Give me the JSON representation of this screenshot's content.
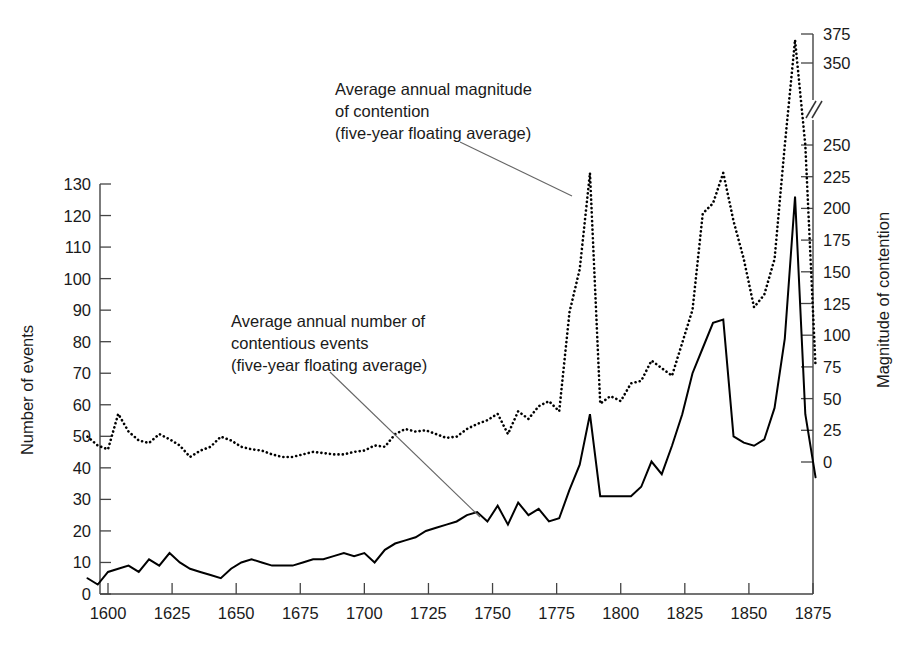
{
  "chart_data": {
    "type": "line",
    "title": "",
    "subtitle": "",
    "xlabel": "",
    "grid": false,
    "legend_position": "inline-annotations",
    "x_axis": {
      "label": "",
      "ticks": [
        1600,
        1625,
        1650,
        1675,
        1700,
        1725,
        1750,
        1775,
        1800,
        1825,
        1850,
        1875
      ],
      "tick_labels": [
        "1600",
        "1625",
        "1650",
        "1675",
        "1700",
        "1725",
        "1750",
        "1775",
        "1800",
        "1825",
        "1850",
        "1875"
      ],
      "xlim": [
        1592,
        1879
      ]
    },
    "y_axis_left": {
      "label": "Number of events",
      "ticks": [
        0,
        10,
        20,
        30,
        40,
        50,
        60,
        70,
        80,
        90,
        100,
        110,
        120,
        130
      ],
      "tick_labels": [
        "0",
        "10",
        "20",
        "30",
        "40",
        "50",
        "60",
        "70",
        "80",
        "90",
        "100",
        "110",
        "120",
        "130"
      ],
      "ylim": [
        0,
        130
      ]
    },
    "y_axis_right": {
      "label": "Magnitude of contention",
      "ticks": [
        0,
        25,
        50,
        75,
        100,
        125,
        150,
        175,
        200,
        225,
        250,
        350,
        375
      ],
      "tick_labels": [
        "0",
        "25",
        "50",
        "75",
        "100",
        "125",
        "150",
        "175",
        "200",
        "225",
        "250",
        "350",
        "375"
      ],
      "ylim": [
        0,
        375
      ],
      "axis_break_between": [
        250,
        350
      ],
      "has_axis_break": true
    },
    "annotations": [
      {
        "id": "magnitude-annotation",
        "lines": [
          "Average annual magnitude",
          "of contention",
          "(five-year floating average)"
        ],
        "text_x": 335,
        "text_y": 95,
        "leader_from": [
          460,
          142
        ],
        "leader_to": [
          572,
          196
        ]
      },
      {
        "id": "events-annotation",
        "lines": [
          "Average annual number of",
          "contentious events",
          "(five-year floating average)"
        ],
        "text_x": 231,
        "text_y": 327,
        "leader_from": [
          330,
          372
        ],
        "leader_to": [
          480,
          517
        ]
      }
    ],
    "series": [
      {
        "name": "Average annual number of contentious events (five-year floating average)",
        "axis": "left",
        "style": "solid",
        "color": "#000000",
        "x": [
          1592,
          1596,
          1600,
          1604,
          1608,
          1612,
          1616,
          1620,
          1624,
          1628,
          1632,
          1636,
          1640,
          1644,
          1648,
          1652,
          1656,
          1660,
          1664,
          1668,
          1672,
          1676,
          1680,
          1684,
          1688,
          1692,
          1696,
          1700,
          1704,
          1708,
          1712,
          1716,
          1720,
          1724,
          1728,
          1732,
          1736,
          1740,
          1744,
          1748,
          1752,
          1756,
          1760,
          1764,
          1768,
          1772,
          1776,
          1780,
          1784,
          1788,
          1792,
          1796,
          1800,
          1804,
          1808,
          1812,
          1816,
          1820,
          1824,
          1828,
          1832,
          1836,
          1840,
          1844,
          1848,
          1852,
          1856,
          1860,
          1864,
          1868,
          1872,
          1876
        ],
        "values": [
          5,
          3,
          7,
          8,
          9,
          7,
          11,
          9,
          13,
          10,
          8,
          7,
          6,
          5,
          8,
          10,
          11,
          10,
          9,
          9,
          9,
          10,
          11,
          11,
          12,
          13,
          12,
          13,
          10,
          14,
          16,
          17,
          18,
          20,
          21,
          22,
          23,
          25,
          26,
          23,
          28,
          22,
          29,
          25,
          27,
          23,
          24,
          33,
          41,
          57,
          31,
          31,
          31,
          31,
          34,
          42,
          38,
          47,
          57,
          70,
          78,
          86,
          87,
          50,
          48,
          47,
          49,
          59,
          81,
          126,
          57,
          37
        ]
      },
      {
        "name": "Average annual magnitude of contention (five-year floating average)",
        "axis": "right",
        "style": "dotted",
        "color": "#000000",
        "x": [
          1592,
          1596,
          1600,
          1604,
          1608,
          1612,
          1616,
          1620,
          1624,
          1628,
          1632,
          1636,
          1640,
          1644,
          1648,
          1652,
          1656,
          1660,
          1664,
          1668,
          1672,
          1676,
          1680,
          1684,
          1688,
          1692,
          1696,
          1700,
          1704,
          1708,
          1712,
          1716,
          1720,
          1724,
          1728,
          1732,
          1736,
          1740,
          1744,
          1748,
          1752,
          1756,
          1760,
          1764,
          1768,
          1772,
          1776,
          1780,
          1784,
          1788,
          1792,
          1796,
          1800,
          1804,
          1808,
          1812,
          1816,
          1820,
          1824,
          1828,
          1832,
          1836,
          1840,
          1844,
          1848,
          1852,
          1856,
          1860,
          1864,
          1868,
          1872,
          1876
        ],
        "values": [
          20,
          13,
          10,
          38,
          24,
          17,
          15,
          22,
          18,
          13,
          4,
          9,
          12,
          20,
          17,
          12,
          10,
          9,
          6,
          4,
          4,
          6,
          8,
          7,
          6,
          6,
          8,
          9,
          13,
          12,
          22,
          26,
          24,
          25,
          22,
          19,
          20,
          26,
          30,
          33,
          38,
          22,
          40,
          34,
          44,
          48,
          40,
          118,
          152,
          228,
          46,
          52,
          48,
          62,
          64,
          80,
          74,
          68,
          94,
          120,
          196,
          204,
          228,
          190,
          160,
          122,
          132,
          160,
          250,
          370,
          250,
          75
        ]
      }
    ]
  },
  "axis_labels": {
    "left": "Number of events",
    "right": "Magnitude of contention"
  }
}
